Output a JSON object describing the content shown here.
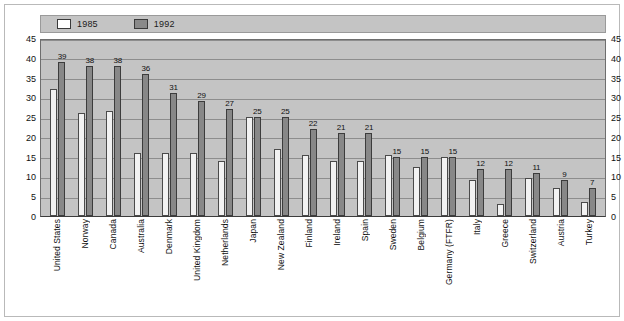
{
  "legend": {
    "items": [
      {
        "label": "1985",
        "swatch": "white-outline-swatch",
        "color": "#ffffff"
      },
      {
        "label": "1992",
        "swatch": "gray-filled-swatch",
        "color": "#888888"
      }
    ]
  },
  "yaxis": {
    "ticks": [
      "45",
      "40",
      "35",
      "30",
      "25",
      "20",
      "15",
      "10",
      "5",
      "0"
    ]
  },
  "chart_data": {
    "type": "bar",
    "title": "",
    "subtitle": "",
    "xlabel": "",
    "ylabel": "",
    "ylim": [
      0,
      45
    ],
    "ytick_step": 5,
    "grid": true,
    "legend_position": "top-left",
    "dual_y_axis": true,
    "categories": [
      "United States",
      "Norway",
      "Canada",
      "Australia",
      "Denmark",
      "United Kingdom",
      "Netherlands",
      "Japan",
      "New Zealand",
      "Finland",
      "Ireland",
      "Spain",
      "Sweden",
      "Belgium",
      "Germany (FTFR)",
      "Italy",
      "Greece",
      "Switzerland",
      "Austria",
      "Turkey"
    ],
    "series": [
      {
        "name": "1985",
        "color": "#ffffff",
        "labels_shown": false,
        "values": [
          32,
          26,
          26.5,
          16,
          16,
          16,
          14,
          25,
          17,
          15.5,
          14,
          14,
          15.5,
          12.5,
          15,
          9,
          3,
          9.5,
          7,
          3.5
        ]
      },
      {
        "name": "1992",
        "color": "#888888",
        "labels_shown": true,
        "values": [
          39,
          38,
          38,
          36,
          31,
          29,
          27,
          25,
          25,
          22,
          21,
          21,
          15,
          15,
          15,
          12,
          12,
          11,
          9,
          7
        ]
      }
    ],
    "value_labels_1992": [
      "39",
      "38",
      "38",
      "36",
      "31",
      "29",
      "27",
      "25",
      "25",
      "22",
      "21",
      "21",
      "15",
      "15",
      "15",
      "12",
      "12",
      "11",
      "9",
      "7"
    ]
  }
}
